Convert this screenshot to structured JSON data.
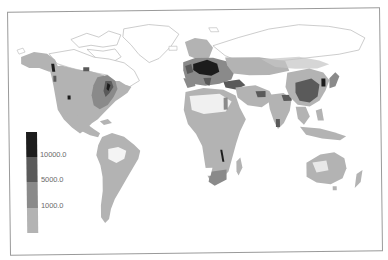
{
  "map": {
    "type": "choropleth",
    "projection": "world-equirectangular",
    "colors": {
      "background": "#ffffff",
      "frame": "#9a9a9a",
      "coastline": "#b8b8b8",
      "class_1": "#b3b3b3",
      "class_2": "#8a8a8a",
      "class_3": "#5a5a5a",
      "class_4": "#1c1c1c"
    }
  },
  "legend": {
    "classes": [
      {
        "range": "> 10000.0",
        "color": "#1c1c1c"
      },
      {
        "range": "5000.0 – 10000.0",
        "color": "#5a5a5a"
      },
      {
        "range": "1000.0 – 5000.0",
        "color": "#8a8a8a"
      },
      {
        "range": "< 1000.0",
        "color": "#b3b3b3"
      }
    ],
    "tick_labels": [
      "10000.0",
      "5000.0",
      "1000.0"
    ]
  },
  "regions": {
    "highest": [
      "Central Europe",
      "Eastern USA coast",
      "Pacific NW coast"
    ],
    "high": [
      "Western Europe",
      "Eastern China",
      "Eastern USA",
      "South Africa",
      "Turkey",
      "Nile valley"
    ],
    "medium": [
      "North America",
      "South America",
      "Africa",
      "India",
      "Russia (west)",
      "Australia (east)",
      "Southeast Asia"
    ]
  }
}
